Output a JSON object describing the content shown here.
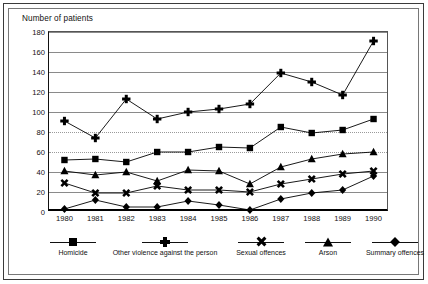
{
  "chart_data": {
    "type": "line",
    "title": "Number of patients",
    "xlabel": "",
    "ylabel": "Number of patients",
    "ylim": [
      0,
      180
    ],
    "ytick_step": 20,
    "yticks": [
      0,
      20,
      40,
      60,
      80,
      100,
      120,
      140,
      160,
      180
    ],
    "grid": true,
    "legend_position": "bottom",
    "categories": [
      1980,
      1981,
      1982,
      1983,
      1984,
      1985,
      1986,
      1987,
      1988,
      1989,
      1990
    ],
    "x_tick_labels": [
      "1980",
      "1981",
      "1982",
      "1983",
      "1984",
      "1985",
      "1986",
      "1987",
      "1988",
      "1989",
      "1990"
    ],
    "series": [
      {
        "name": "Homicide",
        "marker": "square",
        "values": [
          52,
          53,
          50,
          60,
          60,
          65,
          64,
          85,
          79,
          82,
          93
        ]
      },
      {
        "name": "Other violence against the person",
        "marker": "plus",
        "values": [
          91,
          74,
          113,
          93,
          100,
          103,
          108,
          139,
          130,
          117,
          171
        ]
      },
      {
        "name": "Sexual offences",
        "marker": "x",
        "values": [
          29,
          19,
          19,
          26,
          22,
          22,
          20,
          28,
          33,
          38,
          41
        ]
      },
      {
        "name": "Arson",
        "marker": "triangle",
        "values": [
          41,
          37,
          40,
          31,
          42,
          41,
          28,
          45,
          53,
          58,
          60
        ]
      },
      {
        "name": "Summary offences",
        "marker": "diamond",
        "values": [
          3,
          12,
          5,
          5,
          11,
          7,
          2,
          13,
          19,
          22,
          36
        ]
      }
    ]
  },
  "legend": {
    "items": [
      {
        "label": "Homicide",
        "marker": "square"
      },
      {
        "label": "Other violence against the person",
        "marker": "plus"
      },
      {
        "label": "Sexual offences",
        "marker": "x"
      },
      {
        "label": "Arson",
        "marker": "triangle"
      },
      {
        "label": "Summary offences",
        "marker": "diamond"
      }
    ]
  },
  "colors": {
    "series": "#000000",
    "grid": "#8a8a8a",
    "axis": "#111111",
    "background": "#ffffff",
    "frame": "#3a3a3a"
  }
}
